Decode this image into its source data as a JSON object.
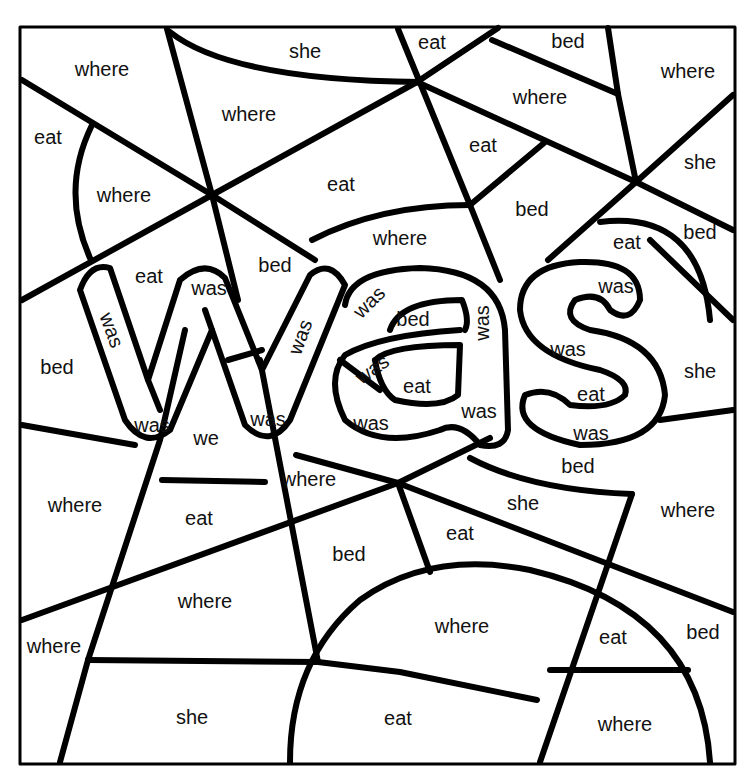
{
  "title_word": "was",
  "colors": {
    "line": "#000000",
    "background": "#ffffff",
    "text": "#111111"
  },
  "regions": [
    {
      "word": "where",
      "x": 102,
      "y": 69
    },
    {
      "word": "she",
      "x": 305,
      "y": 51
    },
    {
      "word": "eat",
      "x": 432,
      "y": 42
    },
    {
      "word": "bed",
      "x": 568,
      "y": 41
    },
    {
      "word": "where",
      "x": 688,
      "y": 71
    },
    {
      "word": "eat",
      "x": 48,
      "y": 137
    },
    {
      "word": "where",
      "x": 249,
      "y": 114
    },
    {
      "word": "where",
      "x": 540,
      "y": 97
    },
    {
      "word": "where",
      "x": 124,
      "y": 195
    },
    {
      "word": "eat",
      "x": 341,
      "y": 184
    },
    {
      "word": "eat",
      "x": 483,
      "y": 145
    },
    {
      "word": "she",
      "x": 700,
      "y": 162
    },
    {
      "word": "bed",
      "x": 532,
      "y": 209
    },
    {
      "word": "where",
      "x": 400,
      "y": 238
    },
    {
      "word": "eat",
      "x": 627,
      "y": 242
    },
    {
      "word": "bed",
      "x": 700,
      "y": 232
    },
    {
      "word": "eat",
      "x": 149,
      "y": 276
    },
    {
      "word": "bed",
      "x": 275,
      "y": 265
    },
    {
      "word": "was",
      "x": 209,
      "y": 288
    },
    {
      "word": "was",
      "x": 112,
      "y": 330,
      "rotate": 70
    },
    {
      "word": "was",
      "x": 300,
      "y": 337,
      "rotate": -70
    },
    {
      "word": "was",
      "x": 369,
      "y": 302,
      "rotate": -45
    },
    {
      "word": "bed",
      "x": 413,
      "y": 319
    },
    {
      "word": "was",
      "x": 482,
      "y": 323,
      "rotate": -90
    },
    {
      "word": "was",
      "x": 616,
      "y": 286
    },
    {
      "word": "bed",
      "x": 57,
      "y": 367
    },
    {
      "word": "was",
      "x": 372,
      "y": 369,
      "rotate": -35
    },
    {
      "word": "eat",
      "x": 417,
      "y": 386
    },
    {
      "word": "was",
      "x": 568,
      "y": 349
    },
    {
      "word": "eat",
      "x": 591,
      "y": 394
    },
    {
      "word": "she",
      "x": 700,
      "y": 371
    },
    {
      "word": "was",
      "x": 152,
      "y": 425
    },
    {
      "word": "we",
      "x": 206,
      "y": 438
    },
    {
      "word": "was",
      "x": 268,
      "y": 419
    },
    {
      "word": "was",
      "x": 371,
      "y": 423
    },
    {
      "word": "was",
      "x": 479,
      "y": 411
    },
    {
      "word": "was",
      "x": 591,
      "y": 433
    },
    {
      "word": "bed",
      "x": 578,
      "y": 466
    },
    {
      "word": "where",
      "x": 309,
      "y": 479
    },
    {
      "word": "she",
      "x": 523,
      "y": 503
    },
    {
      "word": "where",
      "x": 75,
      "y": 505
    },
    {
      "word": "eat",
      "x": 199,
      "y": 518
    },
    {
      "word": "where",
      "x": 688,
      "y": 510
    },
    {
      "word": "eat",
      "x": 460,
      "y": 533
    },
    {
      "word": "bed",
      "x": 349,
      "y": 554
    },
    {
      "word": "where",
      "x": 205,
      "y": 601
    },
    {
      "word": "where",
      "x": 462,
      "y": 626
    },
    {
      "word": "eat",
      "x": 613,
      "y": 637
    },
    {
      "word": "bed",
      "x": 703,
      "y": 632
    },
    {
      "word": "where",
      "x": 54,
      "y": 646
    },
    {
      "word": "she",
      "x": 192,
      "y": 717
    },
    {
      "word": "eat",
      "x": 398,
      "y": 718
    },
    {
      "word": "where",
      "x": 625,
      "y": 724
    }
  ]
}
